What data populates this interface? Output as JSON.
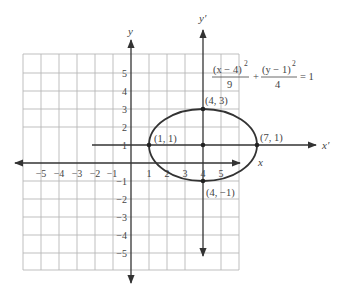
{
  "axes": {
    "x_label": "x",
    "y_label": "y",
    "x_prime_label": "x′",
    "y_prime_label": "y′"
  },
  "ticks": {
    "x": [
      "−5",
      "−4",
      "−3",
      "−2",
      "−1",
      "1",
      "2",
      "3",
      "4",
      "5"
    ],
    "y": [
      "5",
      "4",
      "3",
      "2",
      "1",
      "−1",
      "−2",
      "−3",
      "−4",
      "−5"
    ]
  },
  "equation": {
    "term1_numerator": "(x − 4)",
    "term1_exponent": "2",
    "term1_denominator": "9",
    "plus": "+",
    "term2_numerator": "(y − 1)",
    "term2_exponent": "2",
    "term2_denominator": "4",
    "equals": "= 1"
  },
  "points": {
    "top": "(4, 3)",
    "left": "(1, 1)",
    "right": "(7, 1)",
    "bottom": "(4, −1)"
  },
  "ellipse": {
    "center": [
      4,
      1
    ],
    "a": 3,
    "b": 2
  },
  "colors": {
    "grid": "#b5b5b5",
    "axis": "#333333",
    "curve": "#333333",
    "text": "#444444"
  }
}
